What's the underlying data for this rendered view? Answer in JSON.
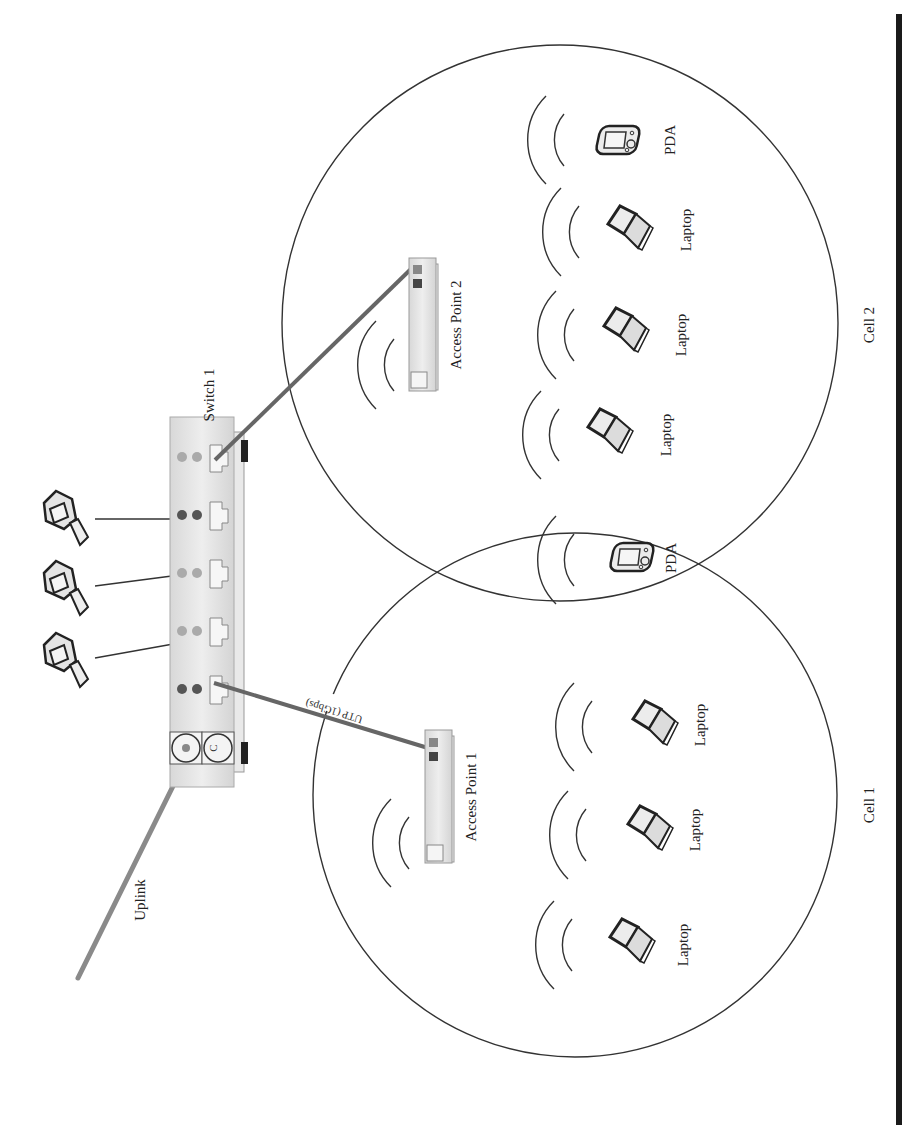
{
  "diagram": {
    "switch": {
      "label": "Switch 1",
      "console_port_label": "C"
    },
    "uplink": {
      "label": "Uplink"
    },
    "link_ap1": {
      "label": "UTP (1Gbps)"
    },
    "access_points": [
      {
        "label": "Access Point 1"
      },
      {
        "label": "Access Point 2"
      }
    ],
    "cells": [
      {
        "label": "Cell 1"
      },
      {
        "label": "Cell 2"
      }
    ],
    "cell2_devices": [
      {
        "label": "PDA"
      },
      {
        "label": "Laptop"
      },
      {
        "label": "Laptop"
      },
      {
        "label": "Laptop"
      }
    ],
    "shared_device": {
      "label": "PDA"
    },
    "cell1_devices": [
      {
        "label": "Laptop"
      },
      {
        "label": "Laptop"
      },
      {
        "label": "Laptop"
      }
    ],
    "wired_clients": [
      "Desktop PC",
      "Desktop PC",
      "Desktop PC"
    ]
  },
  "colors": {
    "line": "#333333",
    "thick_cable": "#666666",
    "uplink_cable": "#888888",
    "device_fill": "#e2e2e2",
    "led_dark": "#555555",
    "led_light": "#aaaaaa",
    "rule": "#1a1a1a"
  }
}
